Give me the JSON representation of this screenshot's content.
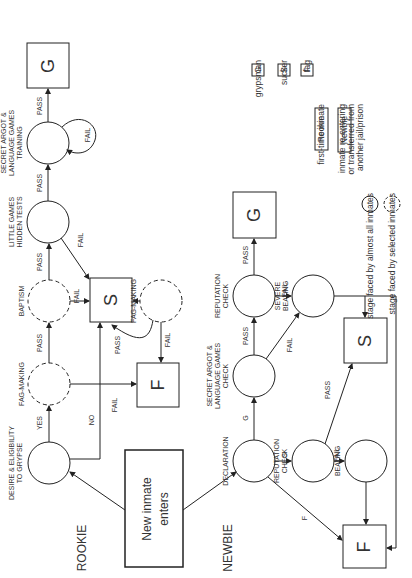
{
  "groups": {
    "rookie": "ROOKIE",
    "newbie": "NEWBIE"
  },
  "start": {
    "line1": "New inmate",
    "line2": "enters"
  },
  "nodes": {
    "desire": [
      "DESIRE & ELIGIBILITY",
      "TO GRYPSE"
    ],
    "fag_making_1": [
      "FAG-MAKING"
    ],
    "baptism": [
      "BAPTISM"
    ],
    "little_games": [
      "LITTLE GAMES",
      "HIDDEN TESTS"
    ],
    "argot_training": [
      "SECRET ARGOT &",
      "LANGUAGE GAMES",
      "TRAINING"
    ],
    "fag_making_2": [
      "FAG-MAKING"
    ],
    "declaration": [
      "DECLARATION"
    ],
    "argot_check": [
      "SECRET ARGOT &",
      "LANGUAGE GAMES",
      "CHECK"
    ],
    "reputation_check_1": [
      "REPUTATION",
      "CHECK"
    ],
    "severe_beating": [
      "SEVERE",
      "BEATING"
    ],
    "reputation_check_2": [
      "REPUTATION",
      "CHECK"
    ],
    "beating": [
      "BEATING"
    ]
  },
  "outcomes": {
    "g": "G",
    "s": "S",
    "f": "F"
  },
  "edges": {
    "yes": "YES",
    "no": "NO",
    "pass": "PASS",
    "fail": "FAIL",
    "g": "G",
    "s": "S",
    "f": "F"
  },
  "legend": {
    "g": {
      "key": "G",
      "text": "grypsman"
    },
    "s": {
      "key": "S",
      "text": "sucker"
    },
    "f": {
      "key": "F",
      "text": "fag"
    },
    "rookie": {
      "key": "Rookie",
      "text": "first-time inmate"
    },
    "newbie": {
      "key": "Newbie",
      "text": [
        "inmate re-entering",
        "or transferred from",
        "another jail/prison"
      ]
    },
    "solid": "stage faced by almost all inmates",
    "dashed": "stage faced by selected inmates"
  }
}
